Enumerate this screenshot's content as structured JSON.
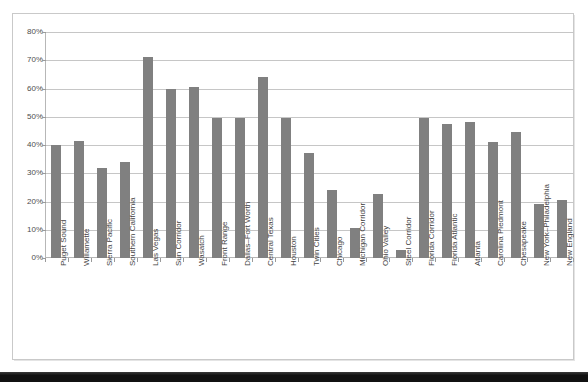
{
  "chart_data": {
    "type": "bar",
    "title": "",
    "subtitle": "",
    "xlabel": "",
    "ylabel": "",
    "ylim": [
      0,
      80
    ],
    "ytick_labels": [
      "80%",
      "70%",
      "60%",
      "50%",
      "40%",
      "30%",
      "20%",
      "10%",
      "0%"
    ],
    "ytick_values": [
      80,
      70,
      60,
      50,
      40,
      30,
      20,
      10,
      0
    ],
    "grid": true,
    "legend": false,
    "legend_position": "none",
    "bar_color": "#808080",
    "gridline_color": "#c6c6c6",
    "axis_color": "#b7b7b7",
    "categories": [
      "Puget Sound",
      "Willamette",
      "Sierra Pacific",
      "Southern California",
      "Las Vegas",
      "Sun Corridor",
      "Wasatch",
      "Front Range",
      "Dallas–Fort Worth",
      "Central Texas",
      "Houston",
      "Twin Cities",
      "Chicago",
      "Michigan Corridor",
      "Ohio Valley",
      "Steel Corridor",
      "Florida Corridor",
      "Florida Atlantic",
      "Atlanta",
      "Carolina Piedmont",
      "Chesapeake",
      "New York–Philadelphia",
      "New England"
    ],
    "values": [
      40,
      41.5,
      32,
      34,
      71,
      60,
      60.5,
      49.5,
      49.5,
      64,
      49.5,
      37,
      24,
      10.5,
      22.5,
      3,
      49.5,
      47.5,
      48,
      41,
      44.5,
      19,
      20.5
    ]
  }
}
